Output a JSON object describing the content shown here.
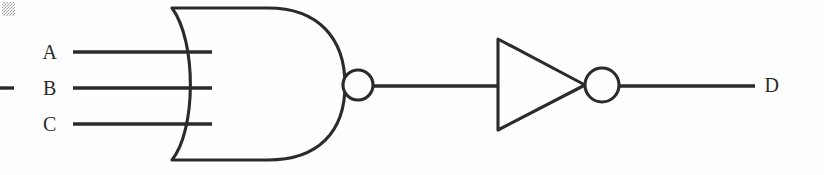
{
  "diagram": {
    "background_color": "#fefefe",
    "line_color": "#2b2b2b",
    "width": 824,
    "height": 175
  },
  "inputs": [
    {
      "label": "A",
      "label_x": 50,
      "label_y": 52,
      "wire_y": 52,
      "wire_x1": 73,
      "wire_x2": 212
    },
    {
      "label": "B",
      "label_x": 50,
      "label_y": 88,
      "wire_y": 88,
      "wire_x1": 73,
      "wire_x2": 212
    },
    {
      "label": "C",
      "label_x": 50,
      "label_y": 124,
      "wire_y": 124,
      "wire_x1": 73,
      "wire_x2": 212
    }
  ],
  "outputs": [
    {
      "label": "D",
      "label_x": 772,
      "label_y": 85,
      "wire_y": 86,
      "wire_x1": 620,
      "wire_x2": 755
    }
  ],
  "gates": [
    {
      "name": "nor-gate",
      "type": "NOR",
      "inputs": 3,
      "body_left": 172,
      "body_right": 345,
      "body_top": 8,
      "body_bottom": 160,
      "bubble_cx": 358,
      "bubble_cy": 85,
      "bubble_r": 15
    },
    {
      "name": "inverter-gate",
      "type": "NOT",
      "inputs": 1,
      "triangle_left": 498,
      "triangle_top": 39,
      "triangle_bottom": 130,
      "triangle_apex_x": 585,
      "triangle_apex_y": 85,
      "bubble_cx": 602,
      "bubble_cy": 85,
      "bubble_r": 17
    }
  ],
  "wires": [
    {
      "name": "nor-to-inverter",
      "x1": 374,
      "y1": 86,
      "x2": 498,
      "y2": 86
    }
  ],
  "artifacts": [
    {
      "name": "scan-corner-mark",
      "x": 2,
      "y": 2,
      "width": 13,
      "height": 14
    },
    {
      "name": "left-edge-dash",
      "x1": 0,
      "y1": 88,
      "x2": 14,
      "y2": 88
    }
  ]
}
